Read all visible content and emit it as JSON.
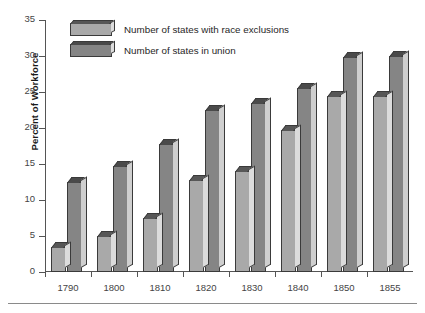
{
  "chart_data": {
    "type": "bar",
    "title": "",
    "xlabel": "",
    "ylabel": "Percent of Workforce",
    "categories": [
      "1790",
      "1800",
      "1810",
      "1820",
      "1830",
      "1840",
      "1850",
      "1855"
    ],
    "series": [
      {
        "name": "Number of states with race exclusions",
        "color": "#a9a9a9",
        "values": [
          3.5,
          5.0,
          7.5,
          12.8,
          14.0,
          19.7,
          24.5,
          24.5
        ]
      },
      {
        "name": "Number of states in union",
        "color": "#858585",
        "values": [
          12.5,
          14.7,
          17.8,
          22.5,
          23.5,
          25.5,
          29.8,
          30.0
        ]
      }
    ],
    "ylim": [
      0,
      35
    ],
    "ytick_step": 5,
    "yticks": [
      "0",
      "5",
      "10",
      "15",
      "20",
      "25",
      "30",
      "35"
    ],
    "grid": false,
    "legend_position": "top-left",
    "style": "3d-bars-grayscale"
  },
  "legend": {
    "entries": [
      {
        "label": "Number of states with race exclusions",
        "swatch": "light"
      },
      {
        "label": "Number of states in union",
        "swatch": "dark"
      }
    ]
  }
}
